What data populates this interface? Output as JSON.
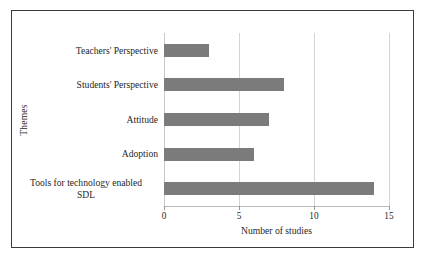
{
  "chart_data": {
    "type": "bar",
    "orientation": "horizontal",
    "title": "",
    "xlabel": "Number of studies",
    "ylabel": "Themes",
    "categories": [
      "Teachers' Perspective",
      "Students' Perspective",
      "Attitude",
      "Adoption",
      "Tools for technology enabled\nSDL"
    ],
    "values": [
      3,
      8,
      7,
      6,
      14
    ],
    "xlim": [
      0,
      15
    ],
    "xticks": [
      0,
      5,
      10,
      15
    ],
    "xtick_labels": [
      "0",
      "5",
      "10",
      "15"
    ],
    "grid": "vertical",
    "legend": "none",
    "bar_color": "#7b7b7b",
    "gridline_color": "#d4d4d4",
    "frame_color": "#3b3b3b",
    "background": "#ffffff"
  }
}
